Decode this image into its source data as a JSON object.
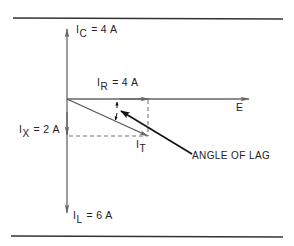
{
  "diagram": {
    "type": "phasor-diagram",
    "colors": {
      "vector": "#666666",
      "border": "#333333",
      "leader": "#111111",
      "text": "#222222",
      "dashed": "#777777"
    },
    "labels": {
      "ic": {
        "main": "I",
        "sub": "C",
        "eq": "=",
        "value": "4 A"
      },
      "ir": {
        "main": "I",
        "sub": "R",
        "eq": "=",
        "value": "4 A"
      },
      "ix": {
        "main": "I",
        "sub": "X",
        "eq": "=",
        "value": "2 A"
      },
      "il": {
        "main": "I",
        "sub": "L",
        "eq": "=",
        "value": "6 A"
      },
      "it": {
        "main": "I",
        "sub": "T"
      },
      "e": "E",
      "angle_of_lag": "ANGLE OF LAG"
    },
    "vectors": [
      {
        "name": "I_C",
        "magnitude": "4 A",
        "direction": "up"
      },
      {
        "name": "I_R",
        "magnitude": "4 A",
        "direction": "right"
      },
      {
        "name": "I_X",
        "magnitude": "2 A",
        "direction": "down"
      },
      {
        "name": "I_L",
        "magnitude": "6 A",
        "direction": "down"
      },
      {
        "name": "I_T",
        "direction": "lagging, down-right"
      },
      {
        "name": "E",
        "direction": "right (reference)"
      }
    ]
  }
}
